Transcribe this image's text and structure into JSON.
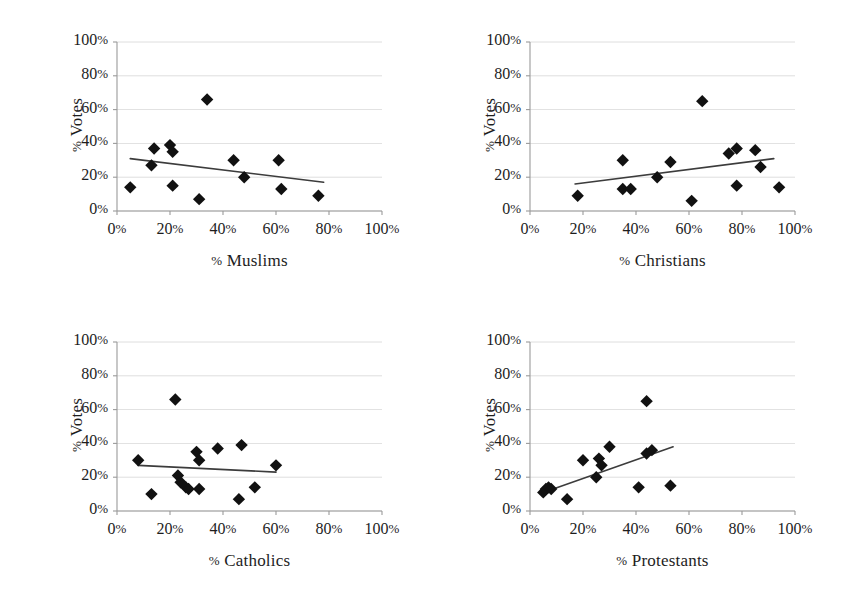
{
  "figure": {
    "title": "",
    "background_color": "#ffffff",
    "marker_color": "#111111",
    "trendline_color": "#3c3c3c",
    "gridline_color": "#c9c9c9",
    "axis_color": "#9a9a9a",
    "panel_count": 4
  },
  "axis_ticks": {
    "x": [
      "0%",
      "20%",
      "40%",
      "60%",
      "80%",
      "100%"
    ],
    "y": [
      "0%",
      "20%",
      "40%",
      "60%",
      "80%",
      "100%"
    ]
  },
  "panels": [
    {
      "name": "muslims",
      "xlabel": "% Muslims",
      "ylabel": "% Votes"
    },
    {
      "name": "christians",
      "xlabel": "% Christians",
      "ylabel": "% Votes"
    },
    {
      "name": "catholics",
      "xlabel": "% Catholics",
      "ylabel": "% Votes"
    },
    {
      "name": "protestants",
      "xlabel": "% Protestants",
      "ylabel": "% Votes"
    }
  ],
  "chart_data": [
    {
      "type": "scatter",
      "title": "",
      "xlabel": "% Muslims",
      "ylabel": "% Votes",
      "xlim": [
        0,
        100
      ],
      "ylim": [
        0,
        100
      ],
      "xticks": [
        0,
        20,
        40,
        60,
        80,
        100
      ],
      "yticks": [
        0,
        20,
        40,
        60,
        80,
        100
      ],
      "grid": true,
      "legend": "none",
      "points": [
        {
          "x": 5,
          "y": 14
        },
        {
          "x": 13,
          "y": 27
        },
        {
          "x": 14,
          "y": 37
        },
        {
          "x": 20,
          "y": 39
        },
        {
          "x": 21,
          "y": 35
        },
        {
          "x": 21,
          "y": 15
        },
        {
          "x": 31,
          "y": 7
        },
        {
          "x": 34,
          "y": 66
        },
        {
          "x": 44,
          "y": 30
        },
        {
          "x": 48,
          "y": 20
        },
        {
          "x": 61,
          "y": 30
        },
        {
          "x": 62,
          "y": 13
        },
        {
          "x": 76,
          "y": 9
        }
      ],
      "trendline": {
        "x0": 5,
        "y0": 31,
        "x1": 78,
        "y1": 17,
        "slope_sign": "negative"
      }
    },
    {
      "type": "scatter",
      "title": "",
      "xlabel": "% Christians",
      "ylabel": "% Votes",
      "xlim": [
        0,
        100
      ],
      "ylim": [
        0,
        100
      ],
      "xticks": [
        0,
        20,
        40,
        60,
        80,
        100
      ],
      "yticks": [
        0,
        20,
        40,
        60,
        80,
        100
      ],
      "grid": true,
      "legend": "none",
      "points": [
        {
          "x": 18,
          "y": 9
        },
        {
          "x": 35,
          "y": 30
        },
        {
          "x": 35,
          "y": 13
        },
        {
          "x": 38,
          "y": 13
        },
        {
          "x": 48,
          "y": 20
        },
        {
          "x": 53,
          "y": 29
        },
        {
          "x": 61,
          "y": 6
        },
        {
          "x": 65,
          "y": 65
        },
        {
          "x": 75,
          "y": 34
        },
        {
          "x": 78,
          "y": 37
        },
        {
          "x": 78,
          "y": 15
        },
        {
          "x": 85,
          "y": 36
        },
        {
          "x": 87,
          "y": 26
        },
        {
          "x": 94,
          "y": 14
        }
      ],
      "trendline": {
        "x0": 17,
        "y0": 16,
        "x1": 92,
        "y1": 31,
        "slope_sign": "positive"
      }
    },
    {
      "type": "scatter",
      "title": "",
      "xlabel": "% Catholics",
      "ylabel": "% Votes",
      "xlim": [
        0,
        100
      ],
      "ylim": [
        0,
        100
      ],
      "xticks": [
        0,
        20,
        40,
        60,
        80,
        100
      ],
      "yticks": [
        0,
        20,
        40,
        60,
        80,
        100
      ],
      "grid": true,
      "legend": "none",
      "points": [
        {
          "x": 8,
          "y": 30
        },
        {
          "x": 13,
          "y": 10
        },
        {
          "x": 22,
          "y": 66
        },
        {
          "x": 23,
          "y": 21
        },
        {
          "x": 24,
          "y": 17
        },
        {
          "x": 26,
          "y": 14
        },
        {
          "x": 27,
          "y": 13
        },
        {
          "x": 30,
          "y": 35
        },
        {
          "x": 31,
          "y": 30
        },
        {
          "x": 31,
          "y": 13
        },
        {
          "x": 38,
          "y": 37
        },
        {
          "x": 46,
          "y": 7
        },
        {
          "x": 47,
          "y": 39
        },
        {
          "x": 52,
          "y": 14
        },
        {
          "x": 60,
          "y": 27
        }
      ],
      "trendline": {
        "x0": 8,
        "y0": 27,
        "x1": 60,
        "y1": 23,
        "slope_sign": "negative"
      }
    },
    {
      "type": "scatter",
      "title": "",
      "xlabel": "% Protestants",
      "ylabel": "% Votes",
      "xlim": [
        0,
        100
      ],
      "ylim": [
        0,
        100
      ],
      "xticks": [
        0,
        20,
        40,
        60,
        80,
        100
      ],
      "yticks": [
        0,
        20,
        40,
        60,
        80,
        100
      ],
      "grid": true,
      "legend": "none",
      "points": [
        {
          "x": 5,
          "y": 11
        },
        {
          "x": 6,
          "y": 13
        },
        {
          "x": 7,
          "y": 14
        },
        {
          "x": 8,
          "y": 13
        },
        {
          "x": 14,
          "y": 7
        },
        {
          "x": 20,
          "y": 30
        },
        {
          "x": 25,
          "y": 20
        },
        {
          "x": 26,
          "y": 31
        },
        {
          "x": 27,
          "y": 27
        },
        {
          "x": 30,
          "y": 38
        },
        {
          "x": 41,
          "y": 14
        },
        {
          "x": 44,
          "y": 65
        },
        {
          "x": 44,
          "y": 34
        },
        {
          "x": 46,
          "y": 36
        },
        {
          "x": 53,
          "y": 15
        }
      ],
      "trendline": {
        "x0": 5,
        "y0": 11,
        "x1": 54,
        "y1": 38,
        "slope_sign": "positive"
      }
    }
  ]
}
